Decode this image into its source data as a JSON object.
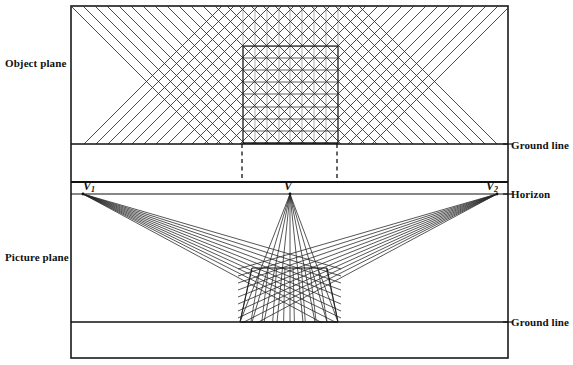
{
  "figure": {
    "labels": {
      "object_plane": "Object plane",
      "picture_plane": "Picture plane",
      "ground_line_top": "Ground line",
      "ground_line_bottom": "Ground line",
      "horizon": "Horizon"
    },
    "vanishing_points": {
      "left": "V",
      "left_sub": "1",
      "center": "V",
      "right": "V",
      "right_sub": "2"
    },
    "colors": {
      "stroke": "#1a1a1a",
      "grid_light": "#8c8c8c",
      "background": "#ffffff"
    }
  },
  "chart_data": {
    "type": "diagram",
    "frame": {
      "x": 71,
      "y": 6,
      "width": 437,
      "height": 352
    },
    "horizontal_rules": [
      {
        "name": "ground-line-top",
        "y": 144,
        "x1": 71,
        "x2": 508,
        "width": 1
      },
      {
        "name": "picture-plane-top",
        "y": 182,
        "x1": 71,
        "x2": 508,
        "width": 2
      },
      {
        "name": "horizon",
        "y": 194,
        "x1": 71,
        "x2": 508,
        "width": 1
      },
      {
        "name": "ground-line-bottom",
        "y": 322,
        "x1": 71,
        "x2": 508,
        "width": 1
      }
    ],
    "dashed_verticals": [
      {
        "x": 242,
        "y1": 144,
        "y2": 182
      },
      {
        "x": 337,
        "y1": 144,
        "y2": 182
      }
    ],
    "object_grid": {
      "x": 243,
      "y": 46,
      "width": 95,
      "height": 97,
      "divisions": 8
    },
    "object_rays": {
      "direction_a_deg": 45,
      "direction_b_deg": -45,
      "count_per_direction": 9,
      "region": {
        "x1": 71,
        "y1": 6,
        "x2": 508,
        "y2": 144
      }
    },
    "vanishing_points": [
      {
        "label": "V1",
        "x": 83,
        "y": 194
      },
      {
        "label": "V",
        "x": 290,
        "y": 194
      },
      {
        "label": "V2",
        "x": 497,
        "y": 194
      }
    ],
    "perspective_grid": {
      "base_y": 322,
      "base_x1": 240,
      "base_x2": 338,
      "top_y": 268,
      "rays_per_vp": 9
    },
    "xlabel": "",
    "ylabel": "",
    "grid": false,
    "legend": "none"
  }
}
